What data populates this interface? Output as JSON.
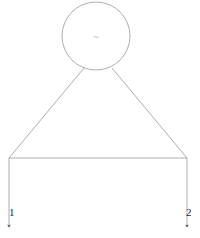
{
  "diagram": {
    "background_color": "#ffffff",
    "line_color": "#8a8a8a",
    "label_color": "#2b2b2b",
    "stroke_width": 0.7,
    "canvas": {
      "width": 200,
      "height": 238
    },
    "circle": {
      "name": "top-circle",
      "center_x": 96,
      "center_y": 36,
      "radius": 34
    },
    "center_mark": {
      "name": "tilde-mark",
      "glyph": "~",
      "x": 96,
      "y": 37
    },
    "diagonals": [
      {
        "name": "left-diagonal",
        "x1": 84,
        "y1": 68,
        "x2": 9,
        "y2": 158
      },
      {
        "name": "right-diagonal",
        "x1": 112,
        "y1": 68,
        "x2": 187,
        "y2": 158
      }
    ],
    "crossbar": {
      "name": "horizontal-crossbar",
      "x1": 9,
      "y1": 158,
      "x2": 187,
      "y2": 158
    },
    "verticals": [
      {
        "name": "left-vertical-arrow",
        "x": 9,
        "y1": 158,
        "y2": 229
      },
      {
        "name": "right-vertical-arrow",
        "x": 187,
        "y1": 158,
        "y2": 229
      }
    ],
    "labels": [
      {
        "name": "node-label-1",
        "text": "1"
      },
      {
        "name": "node-label-2",
        "text": "2"
      }
    ]
  }
}
